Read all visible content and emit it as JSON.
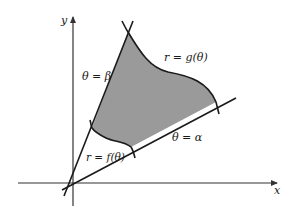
{
  "figure": {
    "type": "polar-region-between-curves",
    "colors": {
      "region_fill": "#9a9a9a",
      "stroke": "#1a1a1a",
      "axis": "#333333",
      "background": "#ffffff"
    },
    "axes": {
      "x_label": "x",
      "y_label": "y"
    },
    "rays": {
      "beta_label": "θ = β",
      "alpha_label": "θ = α"
    },
    "curves": {
      "outer_label": "r = g(θ)",
      "inner_label": "r = f(θ)"
    }
  }
}
